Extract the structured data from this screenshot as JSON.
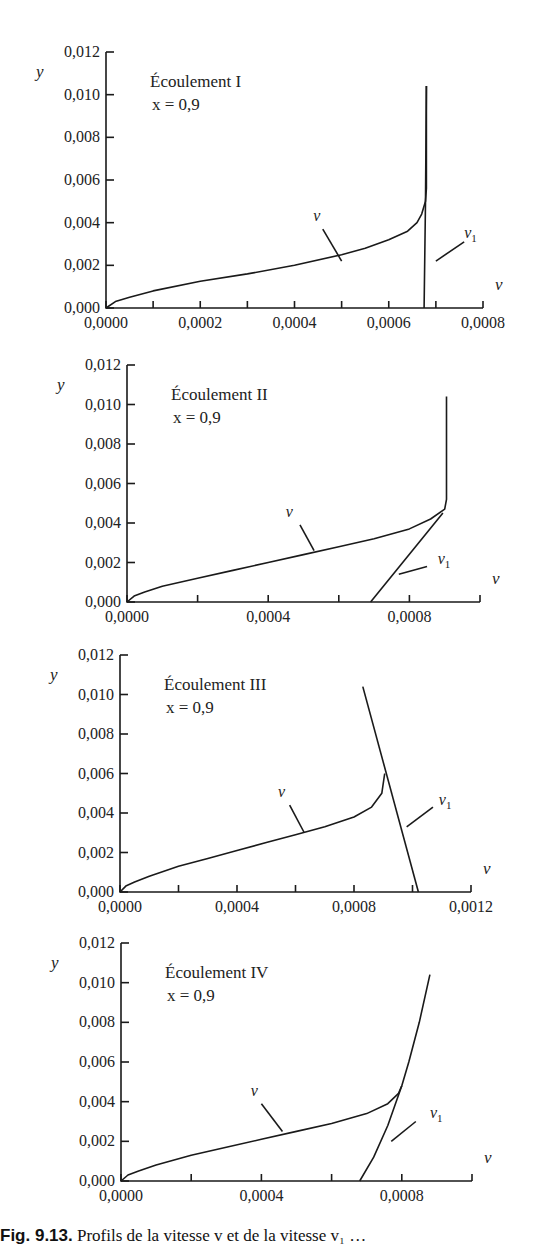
{
  "figure": {
    "caption_prefix": "Fig. 9.13.",
    "caption_text": " Profils de la vitesse v et de la vitesse v₁ …"
  },
  "chart_data": [
    {
      "type": "line",
      "title": "Écoulement I",
      "subtitle": "x = 0,9",
      "xlabel": "v",
      "ylabel": "y",
      "xlim": [
        0,
        0.0008
      ],
      "ylim": [
        0,
        0.012
      ],
      "xticks": [
        0,
        0.0001,
        0.0002,
        0.0003,
        0.0004,
        0.0005,
        0.0006,
        0.0007,
        0.0008
      ],
      "xtick_labels": [
        {
          "v": 0,
          "t": "0,0000"
        },
        {
          "v": 0.0002,
          "t": "0,0002"
        },
        {
          "v": 0.0004,
          "t": "0,0004"
        },
        {
          "v": 0.0006,
          "t": "0,0006"
        },
        {
          "v": 0.0008,
          "t": "0,0008"
        }
      ],
      "yticks": [
        0,
        0.002,
        0.004,
        0.006,
        0.008,
        0.01,
        0.012
      ],
      "ytick_labels": [
        "0,000",
        "0,002",
        "0,004",
        "0,006",
        "0,008",
        "0,010",
        "0,012"
      ],
      "box": {
        "x0": 106,
        "y0": 308,
        "x1": 483,
        "y1": 52
      },
      "series": [
        {
          "name": "v",
          "points": [
            [
              0,
              0
            ],
            [
              2e-05,
              0.0003
            ],
            [
              5e-05,
              0.0005
            ],
            [
              0.0001,
              0.0008
            ],
            [
              0.0002,
              0.00125
            ],
            [
              0.0003,
              0.0016
            ],
            [
              0.0004,
              0.002
            ],
            [
              0.0005,
              0.0025
            ],
            [
              0.00055,
              0.0028
            ],
            [
              0.0006,
              0.0032
            ],
            [
              0.00064,
              0.0036
            ],
            [
              0.00066,
              0.004
            ],
            [
              0.00067,
              0.0044
            ],
            [
              0.000678,
              0.005
            ],
            [
              0.00068,
              0.0056
            ],
            [
              0.00068,
              0.0104
            ]
          ]
        },
        {
          "name": "v₁",
          "points": [
            [
              0.000675,
              0
            ],
            [
              0.000678,
              0.005
            ],
            [
              0.00068,
              0.0104
            ]
          ]
        }
      ],
      "annotations": [
        {
          "text": "v",
          "at": [
            0.00044,
            0.0041
          ],
          "leader": [
            [
              0.00046,
              0.0037
            ],
            [
              0.0005,
              0.0022
            ]
          ]
        },
        {
          "text": "v₁",
          "at": [
            0.00076,
            0.0033
          ],
          "leader": [
            [
              0.00076,
              0.0031
            ],
            [
              0.0007,
              0.0022
            ]
          ]
        }
      ]
    },
    {
      "type": "line",
      "title": "Écoulement II",
      "subtitle": "x = 0,9",
      "xlabel": "v",
      "ylabel": "y",
      "xlim": [
        0,
        0.001
      ],
      "ylim": [
        0,
        0.012
      ],
      "xticks": [
        0,
        0.0002,
        0.0004,
        0.0006,
        0.0008,
        0.001
      ],
      "xtick_labels": [
        {
          "v": 0,
          "t": "0,0000"
        },
        {
          "v": 0.0004,
          "t": "0,0004"
        },
        {
          "v": 0.0008,
          "t": "0,0008"
        }
      ],
      "yticks": [
        0,
        0.002,
        0.004,
        0.006,
        0.008,
        0.01,
        0.012
      ],
      "ytick_labels": [
        "0,000",
        "0,002",
        "0,004",
        "0,006",
        "0,008",
        "0,010",
        "0,012"
      ],
      "box": {
        "x0": 127,
        "y0": 602,
        "x1": 480,
        "y1": 365
      },
      "series": [
        {
          "name": "v",
          "points": [
            [
              0,
              0
            ],
            [
              2e-05,
              0.0003
            ],
            [
              5e-05,
              0.0005
            ],
            [
              0.0001,
              0.0008
            ],
            [
              0.0002,
              0.0012
            ],
            [
              0.0003,
              0.0016
            ],
            [
              0.0004,
              0.002
            ],
            [
              0.0005,
              0.0024
            ],
            [
              0.0006,
              0.0028
            ],
            [
              0.0007,
              0.0032
            ],
            [
              0.0008,
              0.0037
            ],
            [
              0.00086,
              0.0042
            ],
            [
              0.0009,
              0.0047
            ],
            [
              0.000905,
              0.0052
            ],
            [
              0.000905,
              0.0104
            ]
          ]
        },
        {
          "name": "v₁",
          "points": [
            [
              0.00069,
              0
            ],
            [
              0.000895,
              0.0045
            ]
          ]
        }
      ],
      "annotations": [
        {
          "text": "v",
          "at": [
            0.00045,
            0.0043
          ],
          "leader": [
            [
              0.00049,
              0.0039
            ],
            [
              0.00053,
              0.0026
            ]
          ]
        },
        {
          "text": "v₁",
          "at": [
            0.00088,
            0.0019
          ],
          "leader": [
            [
              0.00085,
              0.0018
            ],
            [
              0.00077,
              0.0014
            ]
          ]
        }
      ]
    },
    {
      "type": "line",
      "title": "Écoulement III",
      "subtitle": "x = 0,9",
      "xlabel": "v",
      "ylabel": "y",
      "xlim": [
        0,
        0.0012
      ],
      "ylim": [
        0,
        0.012
      ],
      "xticks": [
        0,
        0.0002,
        0.0004,
        0.0006,
        0.0008,
        0.001,
        0.0012
      ],
      "xtick_labels": [
        {
          "v": 0,
          "t": "0,0000"
        },
        {
          "v": 0.0004,
          "t": "0,0004"
        },
        {
          "v": 0.0008,
          "t": "0,0008"
        },
        {
          "v": 0.0012,
          "t": "0,0012"
        }
      ],
      "yticks": [
        0,
        0.002,
        0.004,
        0.006,
        0.008,
        0.01,
        0.012
      ],
      "ytick_labels": [
        "0,000",
        "0,002",
        "0,004",
        "0,006",
        "0,008",
        "0,010",
        "0,012"
      ],
      "box": {
        "x0": 120,
        "y0": 892,
        "x1": 471,
        "y1": 655
      },
      "series": [
        {
          "name": "v",
          "points": [
            [
              0,
              0
            ],
            [
              2e-05,
              0.0003
            ],
            [
              5e-05,
              0.0005
            ],
            [
              0.0001,
              0.0008
            ],
            [
              0.0002,
              0.0013
            ],
            [
              0.0003,
              0.0017
            ],
            [
              0.0004,
              0.0021
            ],
            [
              0.0005,
              0.0025
            ],
            [
              0.0006,
              0.0029
            ],
            [
              0.0007,
              0.0033
            ],
            [
              0.0008,
              0.0038
            ],
            [
              0.00086,
              0.0043
            ],
            [
              0.000895,
              0.005
            ],
            [
              0.000905,
              0.006
            ]
          ]
        },
        {
          "name": "v₁",
          "points": [
            [
              0.00083,
              0.0104
            ],
            [
              0.00102,
              0
            ]
          ]
        }
      ],
      "annotations": [
        {
          "text": "v",
          "at": [
            0.00054,
            0.0048
          ],
          "leader": [
            [
              0.00058,
              0.0044
            ],
            [
              0.00063,
              0.003
            ]
          ]
        },
        {
          "text": "v₁",
          "at": [
            0.00109,
            0.0044
          ],
          "leader": [
            [
              0.00107,
              0.0043
            ],
            [
              0.00098,
              0.0033
            ]
          ]
        }
      ]
    },
    {
      "type": "line",
      "title": "Écoulement IV",
      "subtitle": "x = 0,9",
      "xlabel": "v",
      "ylabel": "y",
      "xlim": [
        0,
        0.001
      ],
      "ylim": [
        0,
        0.012
      ],
      "xticks": [
        0,
        0.0002,
        0.0004,
        0.0006,
        0.0008,
        0.001
      ],
      "xtick_labels": [
        {
          "v": 0,
          "t": "0,0000"
        },
        {
          "v": 0.0004,
          "t": "0,0004"
        },
        {
          "v": 0.0008,
          "t": "0,0008"
        }
      ],
      "yticks": [
        0,
        0.002,
        0.004,
        0.006,
        0.008,
        0.01,
        0.012
      ],
      "ytick_labels": [
        "0,000",
        "0,002",
        "0,004",
        "0,006",
        "0,008",
        "0,010",
        "0,012"
      ],
      "box": {
        "x0": 121,
        "y0": 1181,
        "x1": 472,
        "y1": 943
      },
      "series": [
        {
          "name": "v",
          "points": [
            [
              0,
              0
            ],
            [
              2e-05,
              0.0003
            ],
            [
              5e-05,
              0.0005
            ],
            [
              0.0001,
              0.0008
            ],
            [
              0.0002,
              0.0013
            ],
            [
              0.0003,
              0.0017
            ],
            [
              0.0004,
              0.0021
            ],
            [
              0.0005,
              0.0025
            ],
            [
              0.0006,
              0.0029
            ],
            [
              0.0007,
              0.0034
            ],
            [
              0.00076,
              0.0039
            ],
            [
              0.00079,
              0.0044
            ],
            [
              0.0008,
              0.0048
            ],
            [
              0.00082,
              0.006
            ],
            [
              0.00085,
              0.008
            ],
            [
              0.00088,
              0.0104
            ]
          ]
        },
        {
          "name": "v₁",
          "points": [
            [
              0.00068,
              0
            ],
            [
              0.00072,
              0.0012
            ],
            [
              0.00076,
              0.0028
            ],
            [
              0.0008,
              0.0048
            ]
          ]
        }
      ],
      "annotations": [
        {
          "text": "v",
          "at": [
            0.00037,
            0.0043
          ],
          "leader": [
            [
              0.0004,
              0.0039
            ],
            [
              0.00046,
              0.0025
            ]
          ]
        },
        {
          "text": "v₁",
          "at": [
            0.00088,
            0.0032
          ],
          "leader": [
            [
              0.00084,
              0.003
            ],
            [
              0.00077,
              0.002
            ]
          ]
        }
      ]
    }
  ]
}
